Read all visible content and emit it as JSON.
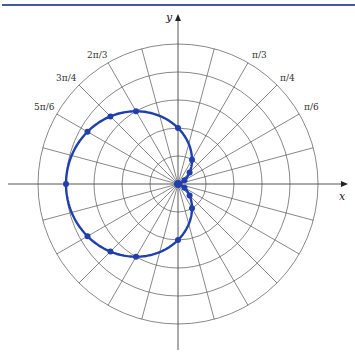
{
  "chart_data": {
    "type": "line",
    "subtype": "polar",
    "title": "",
    "equation_shape": "cardioid r = 1 - cos(theta)",
    "xlabel": "x",
    "ylabel": "y",
    "angle_labels": [
      {
        "text": "π/6",
        "angle_deg": 30
      },
      {
        "text": "π/4",
        "angle_deg": 45
      },
      {
        "text": "π/3",
        "angle_deg": 60
      },
      {
        "text": "2π/3",
        "angle_deg": 120
      },
      {
        "text": "3π/4",
        "angle_deg": 135
      },
      {
        "text": "5π/6",
        "angle_deg": 150
      }
    ],
    "grid": {
      "rings": 5,
      "ring_step": 0.5,
      "r_max": 2.5,
      "spoke_step_deg": 15
    },
    "points": [
      {
        "theta": "0",
        "r": 0
      },
      {
        "theta": "π/6",
        "r": 0.134
      },
      {
        "theta": "π/4",
        "r": 0.293
      },
      {
        "theta": "π/3",
        "r": 0.5
      },
      {
        "theta": "π/2",
        "r": 1
      },
      {
        "theta": "2π/3",
        "r": 1.5
      },
      {
        "theta": "3π/4",
        "r": 1.707
      },
      {
        "theta": "5π/6",
        "r": 1.866
      },
      {
        "theta": "π",
        "r": 2
      },
      {
        "theta": "7π/6",
        "r": 1.866
      },
      {
        "theta": "5π/4",
        "r": 1.707
      },
      {
        "theta": "4π/3",
        "r": 1.5
      },
      {
        "theta": "3π/2",
        "r": 1
      },
      {
        "theta": "5π/3",
        "r": 0.5
      },
      {
        "theta": "7π/4",
        "r": 0.293
      },
      {
        "theta": "11π/6",
        "r": 0.134
      }
    ],
    "point_angles_deg": [
      0,
      30,
      45,
      60,
      90,
      120,
      135,
      150,
      180,
      210,
      225,
      240,
      270,
      300,
      315,
      330
    ],
    "colors": {
      "curve": "#1f3fae",
      "grid": "#555555",
      "rule": "#4257a8"
    }
  }
}
